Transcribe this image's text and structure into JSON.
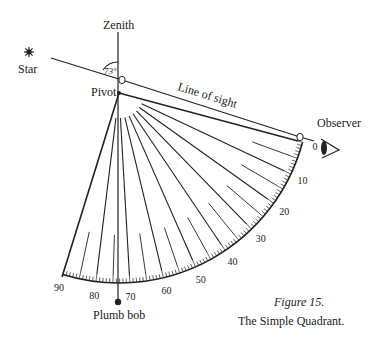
{
  "labels": {
    "zenith": "Zenith",
    "star": "Star",
    "pivot": "Pivot",
    "line_of_sight": "Line of sight",
    "observer": "Observer",
    "plumb_bob": "Plumb bob",
    "angle": "73°"
  },
  "scale": {
    "ticks": [
      "0",
      "10",
      "20",
      "30",
      "40",
      "50",
      "60",
      "70",
      "80",
      "90"
    ]
  },
  "caption": {
    "figure": "Figure 15.",
    "title": "The Simple Quadrant."
  },
  "colors": {
    "ink": "#222222",
    "background": "#ffffff"
  }
}
